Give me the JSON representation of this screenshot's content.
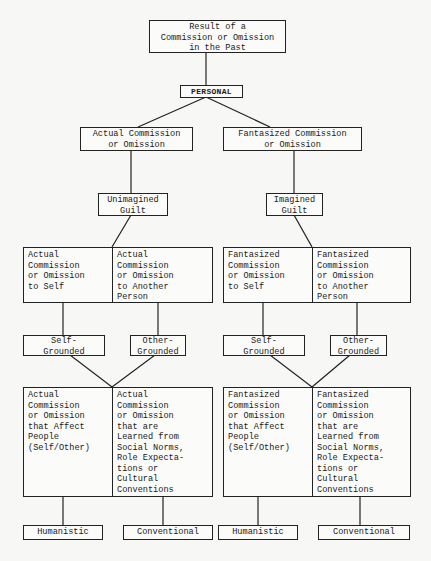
{
  "root": "Result of a\nCommission or Omission\nin the Past",
  "personal": "PERSONAL",
  "branches": {
    "left": {
      "type": "Actual Commission\nor Omission",
      "guilt": "Unimagined\nGuilt",
      "targets": [
        "Actual\nCommission\nor Omission\nto Self",
        "Actual\nCommission\nor Omission\nto Another\nPerson"
      ],
      "grounding": [
        "Self-\nGrounded",
        "Other-\nGrounded"
      ],
      "sources": [
        "Actual\nCommission\nor Omission\nthat Affect\nPeople\n(Self/Other)",
        "Actual\nCommission\nor Omission\nthat are\nLearned from\nSocial Norms,\nRole Expecta-\ntions or\nCultural\nConventions"
      ],
      "outcomes": [
        "Humanistic",
        "Conventional"
      ]
    },
    "right": {
      "type": "Fantasized Commission\nor Omission",
      "guilt": "Imagined\nGuilt",
      "targets": [
        "Fantasized\nCommission\nor Omission\nto Self",
        "Fantasized\nCommission\nor Omission\nto Another\nPerson"
      ],
      "grounding": [
        "Self-\nGrounded",
        "Other-\nGrounded"
      ],
      "sources": [
        "Fantasized\nCommission\nor Omission\nthat Affect\nPeople\n(Self/Other)",
        "Fantasized\nCommission\nor Omission\nthat are\nLearned from\nSocial Norms,\nRole Expecta-\ntions or\nCultural\nConventions"
      ],
      "outcomes": [
        "Humanistic",
        "Conventional"
      ]
    }
  }
}
